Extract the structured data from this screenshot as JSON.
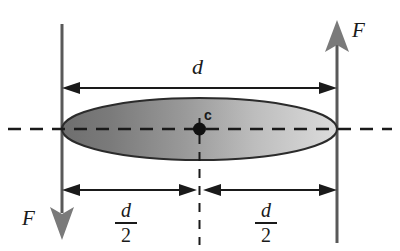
{
  "figure": {
    "colors": {
      "line": "#595959",
      "ink": "#1a1a1a",
      "ellipse_dark": "#767676",
      "ellipse_light": "#d6d6d6",
      "ellipse_outline": "#2b2b2b",
      "background": "#ffffff"
    },
    "labels": {
      "force_right": "F",
      "force_left": "F",
      "diameter": "d",
      "half_left_numerator": "d",
      "half_left_denominator": "2",
      "half_right_numerator": "d",
      "half_right_denominator": "2",
      "center": "c"
    },
    "icons": {
      "arrow_up": "arrow-up-icon",
      "arrow_down": "arrow-down-icon",
      "dimension_arrow": "dimension-arrow-icon",
      "center_dot": "center-point-icon"
    },
    "geometry": {
      "left_line_x": 62,
      "right_line_x": 337,
      "axis_y": 129,
      "ellipse_rx": 137,
      "ellipse_ry": 31,
      "top_dimension_y": 88,
      "bottom_dimension_y": 190
    }
  }
}
